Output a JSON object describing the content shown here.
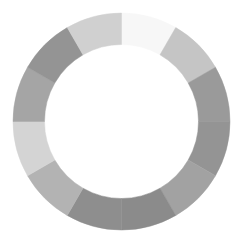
{
  "ring": {
    "segment_count": 12,
    "start": "top",
    "direction": "clockwise",
    "segments": [
      {
        "fraction": 0.0833,
        "color": "#f7f7f7"
      },
      {
        "fraction": 0.0833,
        "color": "#c5c5c5"
      },
      {
        "fraction": 0.0833,
        "color": "#9a9a9a"
      },
      {
        "fraction": 0.0833,
        "color": "#949494"
      },
      {
        "fraction": 0.0833,
        "color": "#a2a2a2"
      },
      {
        "fraction": 0.0833,
        "color": "#8b8b8b"
      },
      {
        "fraction": 0.0833,
        "color": "#8e8e8e"
      },
      {
        "fraction": 0.0833,
        "color": "#b3b3b3"
      },
      {
        "fraction": 0.0833,
        "color": "#d4d4d4"
      },
      {
        "fraction": 0.0833,
        "color": "#a5a5a5"
      },
      {
        "fraction": 0.0833,
        "color": "#949494"
      },
      {
        "fraction": 0.0833,
        "color": "#d0d0d0"
      }
    ]
  }
}
